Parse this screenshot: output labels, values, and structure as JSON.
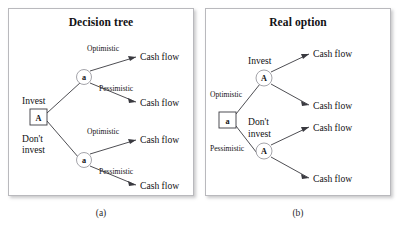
{
  "figure": {
    "panels": [
      {
        "id": "decision-tree",
        "title": "Decision tree",
        "caption": "(a)",
        "root": {
          "shape": "square",
          "letter": "A"
        },
        "decisions": [
          "Invest",
          "Don't\ninvest"
        ],
        "decision_top": "Invest",
        "decision_bottom_line1": "Don't",
        "decision_bottom_line2": "invest",
        "chance_nodes": [
          {
            "shape": "circle",
            "letter": "a"
          },
          {
            "shape": "circle",
            "letter": "a"
          }
        ],
        "branch_labels": [
          "Optimistic",
          "Pessimistic",
          "Optimistic",
          "Pessimistic"
        ],
        "outcomes": [
          "Cash flow",
          "Cash flow",
          "Cash flow",
          "Cash flow"
        ]
      },
      {
        "id": "real-option",
        "title": "Real option",
        "caption": "(b)",
        "root": {
          "shape": "square",
          "letter": "a"
        },
        "branch_labels": [
          "Optimistic",
          "Pessimistic"
        ],
        "chance_nodes": [
          {
            "shape": "circle",
            "letter": "A"
          },
          {
            "shape": "circle",
            "letter": "A"
          }
        ],
        "decision_top": "Invest",
        "decision_bottom_line1": "Don't",
        "decision_bottom_line2": "invest",
        "outcomes": [
          "Cash flow",
          "Cash flow",
          "Cash flow",
          "Cash flow"
        ]
      }
    ]
  },
  "colors": {
    "panel_border": "#b9b9bd",
    "line": "#3a3a40",
    "text": "#121214",
    "circle_stroke": "#9a9aa0",
    "background": "#ffffff"
  }
}
